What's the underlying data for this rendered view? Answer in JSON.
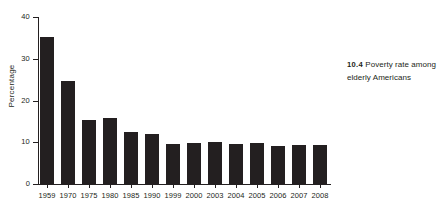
{
  "caption": {
    "number": "10.4",
    "text": "Poverty rate among elderly Americans"
  },
  "chart_data": {
    "type": "bar",
    "title": "",
    "subtitle": "",
    "xlabel": "",
    "ylabel": "Percentage",
    "ylim": [
      0,
      40
    ],
    "yticks": [
      "0",
      "10",
      "20",
      "30",
      "40"
    ],
    "ytick_values": [
      0,
      10,
      20,
      30,
      40
    ],
    "grid": false,
    "legend": "none",
    "bar_color": "#231f20",
    "categories": [
      "1959",
      "1970",
      "1975",
      "1980",
      "1985",
      "1990",
      "1999",
      "2000",
      "2003",
      "2004",
      "2005",
      "2006",
      "2007",
      "2008"
    ],
    "values": [
      35.2,
      24.6,
      15.3,
      15.7,
      12.4,
      12.0,
      9.7,
      9.8,
      10.0,
      9.6,
      9.8,
      9.1,
      9.3,
      9.3
    ],
    "series": [
      {
        "name": "Poverty rate among elderly Americans",
        "values": [
          35.2,
          24.6,
          15.3,
          15.7,
          12.4,
          12.0,
          9.7,
          9.8,
          10.0,
          9.6,
          9.8,
          9.1,
          9.3,
          9.3
        ]
      }
    ]
  }
}
